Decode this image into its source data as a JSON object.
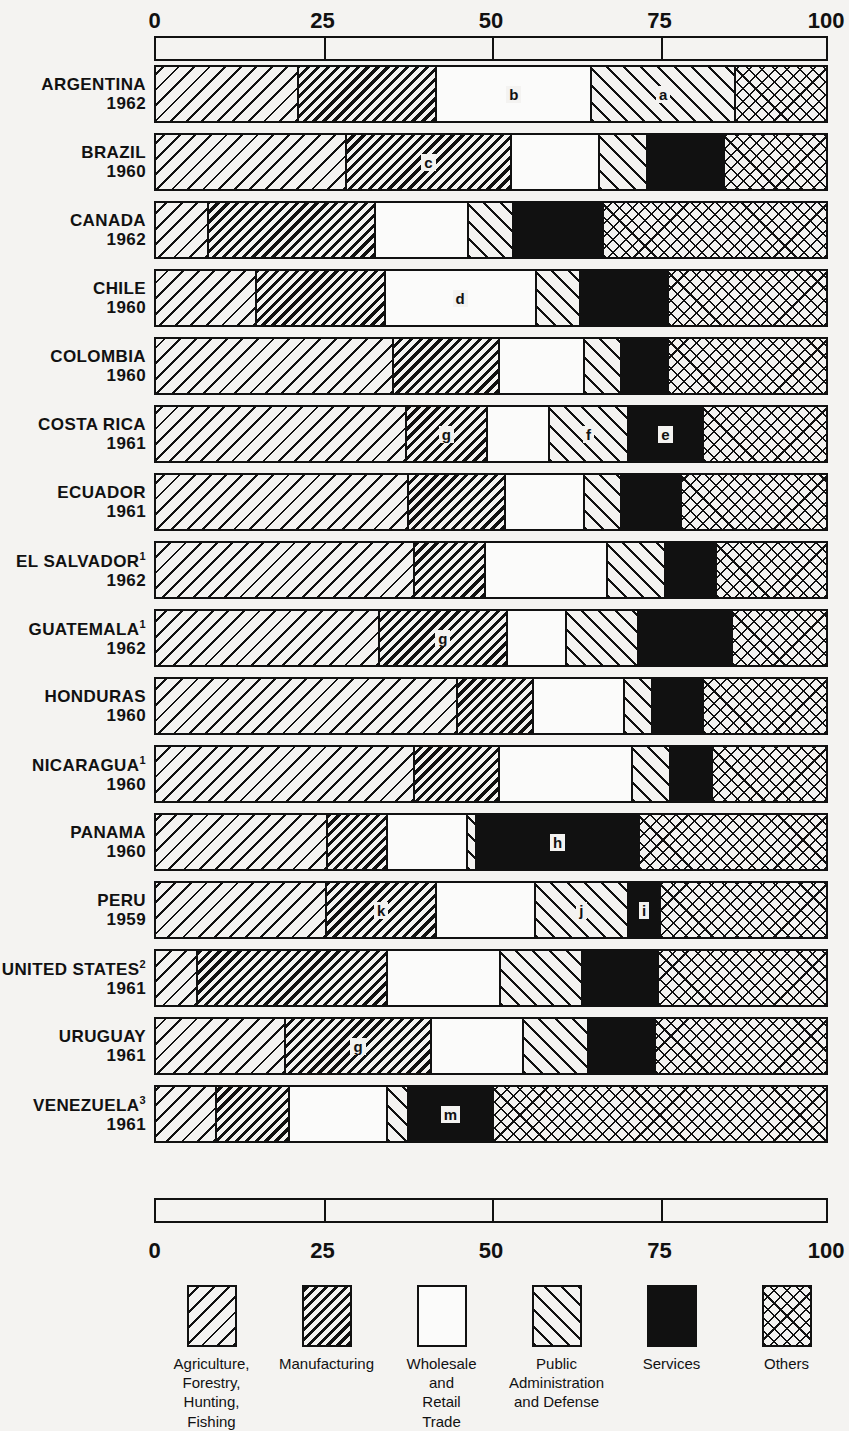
{
  "chart_data": {
    "type": "bar",
    "subtype": "100% stacked horizontal bar",
    "title": "",
    "xlabel": "",
    "ylabel": "",
    "xlim": [
      0,
      100
    ],
    "grid": true,
    "legend_position": "bottom",
    "axis_ticks": [
      "0",
      "25",
      "50",
      "75",
      "100"
    ],
    "axis_tick_values": [
      0,
      25,
      50,
      75,
      100
    ],
    "series": [
      {
        "name": "Agriculture, Forestry, Hunting, Fishing",
        "pattern": "diagonal-wide-hatch",
        "color": "#111111"
      },
      {
        "name": "Manufacturing",
        "pattern": "diagonal-dense-hatch",
        "color": "#111111"
      },
      {
        "name": "Wholesale and Retail Trade",
        "pattern": "blank",
        "color": "#ffffff"
      },
      {
        "name": "Public Administration and Defense",
        "pattern": "reverse-diagonal-hatch",
        "color": "#111111"
      },
      {
        "name": "Services",
        "pattern": "solid-black",
        "color": "#111111"
      },
      {
        "name": "Others",
        "pattern": "cross-hatch",
        "color": "#111111"
      }
    ],
    "categories": [
      "ARGENTINA 1962",
      "BRAZIL 1960",
      "CANADA 1962",
      "CHILE 1960",
      "COLOMBIA 1960",
      "COSTA RICA 1961",
      "ECUADOR 1961",
      "EL SALVADOR 1962",
      "GUATEMALA 1962",
      "HONDURAS 1960",
      "NICARAGUA 1960",
      "PANAMA 1960",
      "PERU 1959",
      "UNITED STATES 1961",
      "URUGUAY 1961",
      "VENEZUELA 1961"
    ],
    "rows": [
      {
        "country": "ARGENTINA",
        "footnote": "",
        "year": "1962",
        "values": [
          21.4,
          20.6,
          23.1,
          21.5,
          0.0,
          13.4
        ],
        "labels": [
          "",
          "",
          "b",
          "a",
          "",
          ""
        ]
      },
      {
        "country": "BRAZIL",
        "footnote": "",
        "year": "1960",
        "values": [
          28.5,
          24.6,
          13.1,
          7.2,
          11.6,
          15.0
        ],
        "labels": [
          "",
          "c",
          "",
          "",
          "",
          ""
        ]
      },
      {
        "country": "CANADA",
        "footnote": "",
        "year": "1962",
        "values": [
          7.9,
          24.9,
          13.9,
          6.7,
          13.5,
          33.1
        ],
        "labels": [
          "",
          "",
          "",
          "",
          "",
          ""
        ]
      },
      {
        "country": "CHILE",
        "footnote": "",
        "year": "1960",
        "values": [
          15.1,
          19.2,
          22.5,
          6.6,
          13.2,
          23.4
        ],
        "labels": [
          "",
          "",
          "d",
          "",
          "",
          ""
        ]
      },
      {
        "country": "COLOMBIA",
        "footnote": "",
        "year": "1960",
        "values": [
          35.5,
          15.8,
          12.8,
          5.5,
          7.0,
          23.4
        ],
        "labels": [
          "",
          "",
          "",
          "",
          "",
          ""
        ]
      },
      {
        "country": "COSTA RICA",
        "footnote": "",
        "year": "1961",
        "values": [
          37.4,
          12.2,
          9.2,
          11.8,
          11.2,
          18.2
        ],
        "labels": [
          "",
          "g",
          "",
          "f",
          "e",
          ""
        ]
      },
      {
        "country": "ECUADOR",
        "footnote": "",
        "year": "1961",
        "values": [
          37.8,
          14.4,
          11.9,
          5.5,
          8.9,
          21.5
        ],
        "labels": [
          "",
          "",
          "",
          "",
          "",
          ""
        ]
      },
      {
        "country": "EL SALVADOR",
        "footnote": "1",
        "year": "1962",
        "values": [
          38.7,
          10.6,
          18.2,
          8.6,
          7.7,
          16.2
        ],
        "labels": [
          "",
          "",
          "",
          "",
          "",
          ""
        ]
      },
      {
        "country": "GUATEMALA",
        "footnote": "1",
        "year": "1962",
        "values": [
          33.4,
          19.1,
          8.8,
          10.8,
          14.0,
          13.9
        ],
        "labels": [
          "",
          "g",
          "",
          "",
          "",
          ""
        ]
      },
      {
        "country": "HONDURAS",
        "footnote": "",
        "year": "1960",
        "values": [
          45.1,
          11.3,
          13.6,
          4.2,
          7.6,
          18.2
        ],
        "labels": [
          "",
          "",
          "",
          "",
          "",
          ""
        ]
      },
      {
        "country": "NICARAGUA",
        "footnote": "1",
        "year": "1960",
        "values": [
          38.7,
          12.6,
          19.9,
          5.7,
          6.2,
          16.9
        ],
        "labels": [
          "",
          "",
          "",
          "",
          "",
          ""
        ]
      },
      {
        "country": "PANAMA",
        "footnote": "",
        "year": "1960",
        "values": [
          25.7,
          8.9,
          12.0,
          1.3,
          24.4,
          27.7
        ],
        "labels": [
          "",
          "",
          "",
          "",
          "h",
          ""
        ]
      },
      {
        "country": "PERU",
        "footnote": "",
        "year": "1959",
        "values": [
          25.5,
          16.5,
          14.7,
          13.9,
          4.8,
          24.6
        ],
        "labels": [
          "",
          "k",
          "",
          "j",
          "i",
          ""
        ]
      },
      {
        "country": "UNITED STATES",
        "footnote": "2",
        "year": "1961",
        "values": [
          6.2,
          28.4,
          16.9,
          12.3,
          11.3,
          24.9
        ],
        "labels": [
          "",
          "",
          "",
          "",
          "",
          ""
        ]
      },
      {
        "country": "URUGUAY",
        "footnote": "",
        "year": "1961",
        "values": [
          19.4,
          21.8,
          13.7,
          9.8,
          9.9,
          25.4
        ],
        "labels": [
          "",
          "g",
          "",
          "",
          "",
          ""
        ]
      },
      {
        "country": "VENEZUELA",
        "footnote": "3",
        "year": "1961",
        "values": [
          9.1,
          10.9,
          14.7,
          3.1,
          12.6,
          49.6
        ],
        "labels": [
          "",
          "",
          "",
          "",
          "m",
          ""
        ]
      }
    ]
  },
  "axis": {
    "top_ticks": [
      "0",
      "25",
      "50",
      "75",
      "100"
    ],
    "bottom_ticks": [
      "0",
      "25",
      "50",
      "75",
      "100"
    ]
  },
  "legend": {
    "items": [
      {
        "key": "agriculture",
        "label": "Agriculture,\nForestry,\nHunting,\nFishing",
        "pattern": "diagonal-wide-hatch"
      },
      {
        "key": "manufacturing",
        "label": "Manufacturing",
        "pattern": "diagonal-dense-hatch"
      },
      {
        "key": "trade",
        "label": "Wholesale\nand\nRetail\nTrade",
        "pattern": "blank"
      },
      {
        "key": "public-administration",
        "label": "Public\nAdministration\nand Defense",
        "pattern": "reverse-diagonal-hatch"
      },
      {
        "key": "services",
        "label": "Services",
        "pattern": "solid-black"
      },
      {
        "key": "others",
        "label": "Others",
        "pattern": "cross-hatch"
      }
    ]
  },
  "rows_labels": {
    "argentina": {
      "name": "ARGENTINA",
      "sup": "",
      "year": "1962"
    },
    "brazil": {
      "name": "BRAZIL",
      "sup": "",
      "year": "1960"
    },
    "canada": {
      "name": "CANADA",
      "sup": "",
      "year": "1962"
    },
    "chile": {
      "name": "CHILE",
      "sup": "",
      "year": "1960"
    },
    "colombia": {
      "name": "COLOMBIA",
      "sup": "",
      "year": "1960"
    },
    "costa_rica": {
      "name": "COSTA RICA",
      "sup": "",
      "year": "1961"
    },
    "ecuador": {
      "name": "ECUADOR",
      "sup": "",
      "year": "1961"
    },
    "el_salvador": {
      "name": "EL SALVADOR",
      "sup": "1",
      "year": "1962"
    },
    "guatemala": {
      "name": "GUATEMALA",
      "sup": "1",
      "year": "1962"
    },
    "honduras": {
      "name": "HONDURAS",
      "sup": "",
      "year": "1960"
    },
    "nicaragua": {
      "name": "NICARAGUA",
      "sup": "1",
      "year": "1960"
    },
    "panama": {
      "name": "PANAMA",
      "sup": "",
      "year": "1960"
    },
    "peru": {
      "name": "PERU",
      "sup": "",
      "year": "1959"
    },
    "united_states": {
      "name": "UNITED\nSTATES",
      "sup": "2",
      "year": "1961"
    },
    "uruguay": {
      "name": "URUGUAY",
      "sup": "",
      "year": "1961"
    },
    "venezuela": {
      "name": "VENEZUELA",
      "sup": "3",
      "year": "1961"
    }
  }
}
